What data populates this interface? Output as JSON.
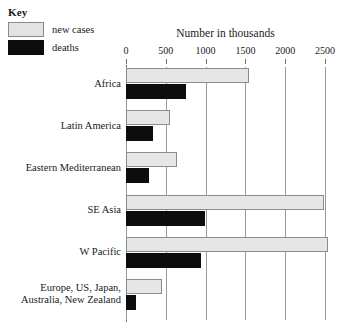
{
  "legend": {
    "title": "Key",
    "items": [
      {
        "label": "new cases",
        "swatch": "light-gray-box",
        "color": "#e3e3e1"
      },
      {
        "label": "deaths",
        "swatch": "black-box",
        "color": "#0d0d0d"
      }
    ]
  },
  "chart_data": {
    "type": "bar",
    "orientation": "horizontal",
    "title": "Number in thousands",
    "xlabel": "Number in thousands",
    "ylabel": "",
    "xlim": [
      0,
      2500
    ],
    "xticks": [
      0,
      500,
      1000,
      1500,
      2000,
      2500
    ],
    "xticklabels": [
      "0",
      "500",
      "1000",
      "1500",
      "2000",
      "2500"
    ],
    "grid": true,
    "grid_axis": "x",
    "legend_position": "top-left-outside",
    "categories": [
      "Africa",
      "Latin America",
      "Eastern Mediterranean",
      "SE Asia",
      "W Pacific",
      "Europe, US, Japan, Australia, New Zealand"
    ],
    "category_lines": [
      [
        "Africa"
      ],
      [
        "Latin America"
      ],
      [
        "Eastern Mediterranean"
      ],
      [
        "SE Asia"
      ],
      [
        "W Pacific"
      ],
      [
        "Europe, US, Japan,",
        "Australia, New Zealand"
      ]
    ],
    "series": [
      {
        "name": "new cases",
        "color": "#e3e3e1",
        "values": [
          1550,
          550,
          640,
          2490,
          2540,
          450
        ]
      },
      {
        "name": "deaths",
        "color": "#0d0d0d",
        "values": [
          750,
          340,
          285,
          990,
          940,
          120
        ]
      }
    ]
  }
}
